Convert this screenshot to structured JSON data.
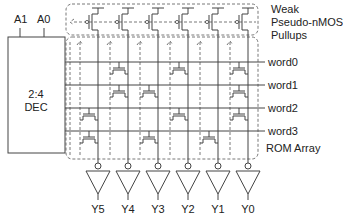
{
  "decoder": {
    "label_line1": "2:4",
    "label_line2": "DEC",
    "inputs": [
      "A1",
      "A0"
    ]
  },
  "pullups": {
    "label_lines": [
      "Weak",
      "Pseudo-nMOS",
      "Pullups"
    ]
  },
  "rom": {
    "label": "ROM Array",
    "word_lines": [
      "word0",
      "word1",
      "word2",
      "word3"
    ],
    "outputs": [
      "Y5",
      "Y4",
      "Y3",
      "Y2",
      "Y1",
      "Y0"
    ],
    "transistors": {
      "word0": [
        "Y4",
        "Y2",
        "Y0"
      ],
      "word1": [
        "Y4",
        "Y3",
        "Y0"
      ],
      "word2": [
        "Y5",
        "Y2",
        "Y0"
      ],
      "word3": [
        "Y5",
        "Y3",
        "Y1"
      ]
    }
  },
  "colors": {
    "line": "#444444",
    "text": "#222222",
    "background": "#ffffff"
  }
}
